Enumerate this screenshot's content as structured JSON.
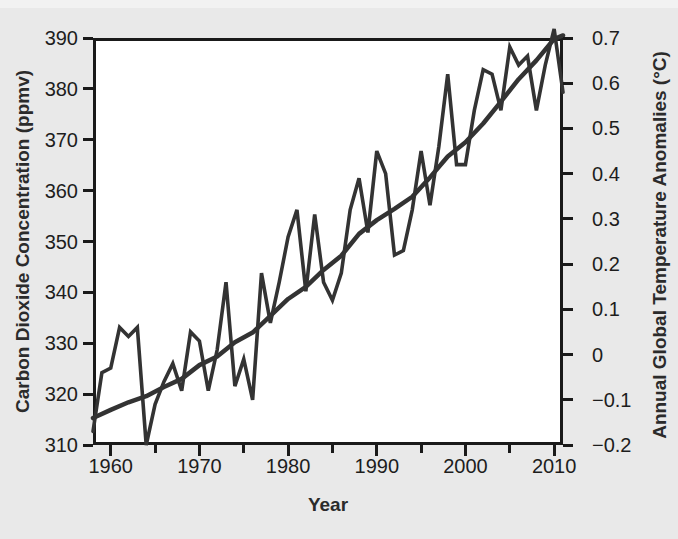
{
  "chart_data": {
    "type": "line",
    "title": "",
    "xlabel": "Year",
    "ylabel": "Carbon Dioxide Concentration (ppmv)",
    "ylabel_right": "Annual Global Temperature Anomalies (°C)",
    "grid": false,
    "legend": "none",
    "xlim": [
      1958,
      2011
    ],
    "ylim": [
      310,
      390
    ],
    "ylim_right": [
      -0.2,
      0.7
    ],
    "xticks": [
      1960,
      1970,
      1980,
      1990,
      2000,
      2010
    ],
    "xticklabels": [
      "1960",
      "1970",
      "1980",
      "1990",
      "2000",
      "2010"
    ],
    "xminorticks": [
      1965,
      1975,
      1985,
      1995,
      2005
    ],
    "yticks": [
      310,
      320,
      330,
      340,
      350,
      360,
      370,
      380,
      390
    ],
    "yticklabels": [
      "310",
      "320",
      "330",
      "340",
      "350",
      "360",
      "370",
      "380",
      "390"
    ],
    "yticks_right": [
      -0.2,
      -0.1,
      0,
      0.1,
      0.2,
      0.3,
      0.4,
      0.5,
      0.6,
      0.7
    ],
    "yticklabels_right": [
      "−0.2",
      "−0.1",
      "0",
      "0.1",
      "0.2",
      "0.3",
      "0.4",
      "0.5",
      "0.6",
      "0.7"
    ],
    "line_color": "#333333",
    "series": [
      {
        "name": "Carbon Dioxide Concentration",
        "axis": "left",
        "unit": "ppmv",
        "smooth": true,
        "x": [
          1958,
          1960,
          1962,
          1964,
          1966,
          1968,
          1970,
          1972,
          1974,
          1976,
          1978,
          1980,
          1982,
          1984,
          1986,
          1988,
          1990,
          1992,
          1994,
          1996,
          1998,
          2000,
          2002,
          2004,
          2006,
          2008,
          2010,
          2011
        ],
        "values": [
          315.3,
          316.9,
          318.4,
          319.6,
          321.4,
          323.0,
          325.7,
          327.4,
          330.2,
          332.1,
          335.4,
          338.7,
          341.1,
          344.4,
          347.2,
          351.5,
          354.2,
          356.4,
          358.8,
          362.6,
          366.7,
          369.5,
          373.2,
          377.5,
          381.9,
          385.6,
          389.8,
          390.5
        ]
      },
      {
        "name": "Annual Global Temperature Anomalies",
        "axis": "right",
        "unit": "°C",
        "smooth": false,
        "x": [
          1958,
          1959,
          1960,
          1961,
          1962,
          1963,
          1964,
          1965,
          1966,
          1967,
          1968,
          1969,
          1970,
          1971,
          1972,
          1973,
          1974,
          1975,
          1976,
          1977,
          1978,
          1979,
          1980,
          1981,
          1982,
          1983,
          1984,
          1985,
          1986,
          1987,
          1988,
          1989,
          1990,
          1991,
          1992,
          1993,
          1994,
          1995,
          1996,
          1997,
          1998,
          1999,
          2000,
          2001,
          2002,
          2003,
          2004,
          2005,
          2006,
          2007,
          2008,
          2009,
          2010,
          2011
        ],
        "values": [
          -0.17,
          -0.04,
          -0.03,
          0.06,
          0.04,
          0.06,
          -0.2,
          -0.11,
          -0.06,
          -0.02,
          -0.08,
          0.05,
          0.03,
          -0.08,
          0.01,
          0.16,
          -0.07,
          -0.01,
          -0.1,
          0.18,
          0.07,
          0.16,
          0.26,
          0.32,
          0.14,
          0.31,
          0.16,
          0.12,
          0.18,
          0.32,
          0.39,
          0.27,
          0.45,
          0.4,
          0.22,
          0.23,
          0.32,
          0.45,
          0.33,
          0.46,
          0.62,
          0.42,
          0.42,
          0.54,
          0.63,
          0.62,
          0.54,
          0.68,
          0.64,
          0.66,
          0.54,
          0.64,
          0.72,
          0.58
        ]
      }
    ]
  },
  "axis_labels": {
    "left": "Carbon Dioxide Concentration (ppmv)",
    "right": "Annual Global Temperature Anomalies (°C)",
    "bottom": "Year"
  },
  "colors": {
    "background": "#e9e9e9",
    "plot_background": "#ffffff",
    "axis": "#1a1a1a",
    "line": "#333333",
    "text": "#1d1d1d"
  }
}
